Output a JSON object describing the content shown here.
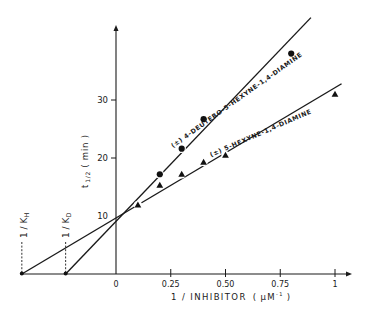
{
  "chart_data": {
    "type": "line",
    "title": "",
    "xlabel": "1 / INHIBITOR ( μM⁻¹ )",
    "ylabel": "t 1/2 ( min )",
    "xlim": [
      -0.43,
      1.07
    ],
    "ylim": [
      0,
      42
    ],
    "grid": false,
    "x_ticks": [
      {
        "value": 0,
        "label": "0"
      },
      {
        "value": 0.25,
        "label": "0.25"
      },
      {
        "value": 0.5,
        "label": "0.50"
      },
      {
        "value": 0.75,
        "label": "0.75"
      },
      {
        "value": 1,
        "label": "1"
      }
    ],
    "y_ticks": [
      {
        "value": 10,
        "label": "10"
      },
      {
        "value": 20,
        "label": "20"
      },
      {
        "value": 30,
        "label": "30"
      }
    ],
    "series": [
      {
        "name": "(±) 4-DEUTERO-5-HEXYNE-1,4-DIAMINE",
        "marker": "circle",
        "x": [
          0.2,
          0.3,
          0.4,
          0.8
        ],
        "y": [
          17.2,
          21.6,
          26.7,
          38.0
        ],
        "fit_line": {
          "x0": -0.23,
          "y0": 0,
          "x1": 0.89,
          "y1": 44.2
        }
      },
      {
        "name": "(±) 5-HEXYNE-1,4-DIAMINE",
        "marker": "triangle",
        "x": [
          0.1,
          0.2,
          0.3,
          0.4,
          0.5,
          1.0
        ],
        "y": [
          11.9,
          15.3,
          17.2,
          19.3,
          20.5,
          31.0
        ],
        "fit_line": {
          "x0": -0.43,
          "y0": 0,
          "x1": 1.03,
          "y1": 32.8
        }
      }
    ],
    "annotations": [
      {
        "text": "1 / K_H",
        "x": -0.43,
        "kind": "x-intercept"
      },
      {
        "text": "1 / K_D",
        "x": -0.23,
        "kind": "x-intercept"
      }
    ],
    "legend_position": "inline labels along lines"
  },
  "labels": {
    "xlabel": "1 / INHIBITOR",
    "xunit_open": "(",
    "xunit": "μM",
    "xunit_exp": "-1",
    "xunit_close": ")",
    "ylabel_t": "t",
    "ylabel_sub": "1/2",
    "ylabel_unit": "( min )",
    "kh_main": "1 / K",
    "kh_sub": "H",
    "kd_main": "1 / K",
    "kd_sub": "D",
    "series_d": "(±) 4-DEUTERO-5-HEXYNE-1,4-DIAMINE",
    "series_h": "(±) 5-HEXYNE-1,4-DIAMINE"
  }
}
